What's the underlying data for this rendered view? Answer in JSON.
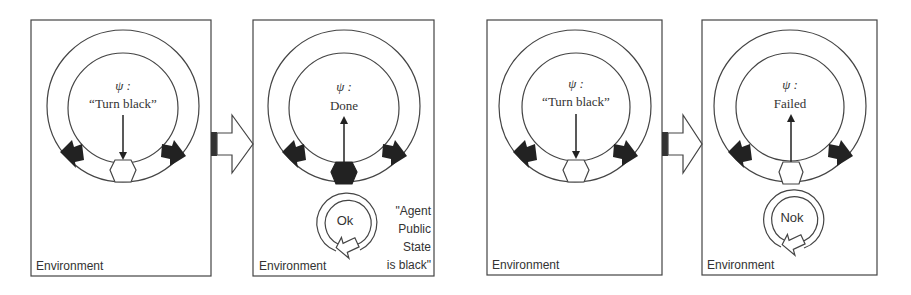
{
  "diagram": {
    "panels": [
      {
        "id": "panel-1",
        "psi_symbol": "ψ :",
        "goal_text": "“Turn black”",
        "environment_label": "Environment",
        "arrow_direction": "down",
        "hexagon_state": "white",
        "feedback": null,
        "note_lines": []
      },
      {
        "id": "panel-2",
        "psi_symbol": "ψ :",
        "goal_text": "Done",
        "environment_label": "Environment",
        "arrow_direction": "up",
        "hexagon_state": "black",
        "feedback": "Ok",
        "note_lines": [
          "\"Agent",
          "Public",
          "State",
          "is black\""
        ]
      },
      {
        "id": "panel-3",
        "psi_symbol": "ψ :",
        "goal_text": "“Turn black”",
        "environment_label": "Environment",
        "arrow_direction": "down",
        "hexagon_state": "white",
        "feedback": null,
        "note_lines": []
      },
      {
        "id": "panel-4",
        "psi_symbol": "ψ :",
        "goal_text": "Failed",
        "environment_label": "Environment",
        "arrow_direction": "up",
        "hexagon_state": "white",
        "feedback": "Nok",
        "note_lines": []
      }
    ],
    "colors": {
      "stroke": "#333333",
      "fill_dark": "#222222",
      "text": "#333333",
      "background": "#ffffff"
    }
  }
}
